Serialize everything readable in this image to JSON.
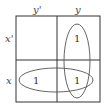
{
  "kmap": {
    "col_labels": [
      "y'",
      "y"
    ],
    "row_labels": [
      "x'",
      "x"
    ],
    "cells": [
      [
        "",
        "1"
      ],
      [
        "1",
        "1"
      ]
    ],
    "groups": [
      {
        "name": "column y",
        "cells": [
          [
            0,
            1
          ],
          [
            1,
            1
          ]
        ]
      },
      {
        "name": "row x",
        "cells": [
          [
            1,
            0
          ],
          [
            1,
            1
          ]
        ]
      }
    ]
  }
}
